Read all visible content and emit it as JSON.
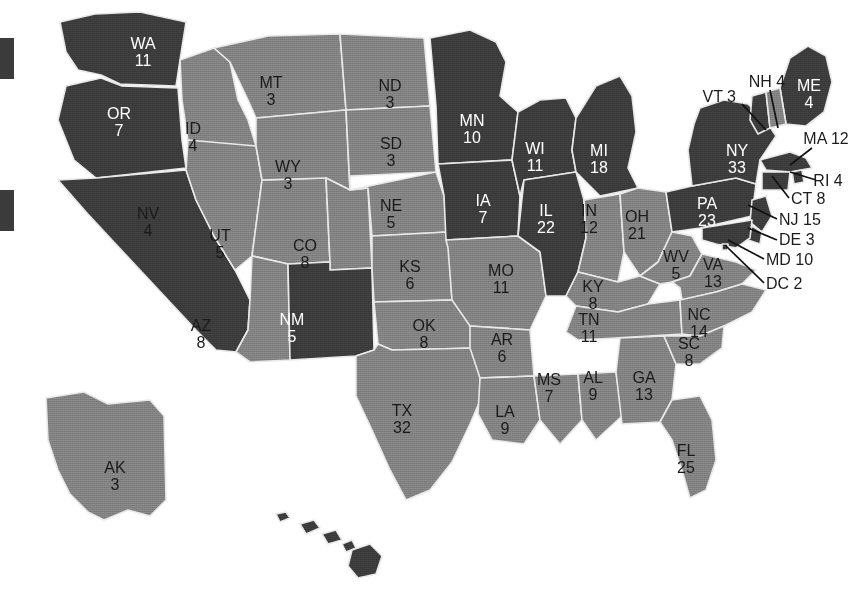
{
  "map": {
    "title": "United States Electoral College Map",
    "colors": {
      "dark_fill": "#3b3b3b",
      "light_fill": "#808080",
      "border": "#e8e8e8",
      "background": "#ffffff",
      "dark_label_text": "#1a1a1a",
      "light_label_text": "#ffffff",
      "leader_line": "#111111"
    },
    "legend": {
      "swatches": [
        {
          "name": "legend-swatch-top",
          "color": "#3b3b3b",
          "x": 0,
          "y": 38,
          "width": 14,
          "height": 41
        },
        {
          "name": "legend-swatch-bottom",
          "color": "#3b3b3b",
          "x": 0,
          "y": 190,
          "width": 14,
          "height": 41
        }
      ]
    },
    "states": [
      {
        "code": "WA",
        "votes": "11",
        "shade": "dark",
        "label_x": 143,
        "label_y": 45
      },
      {
        "code": "OR",
        "votes": "7",
        "shade": "dark",
        "label_x": 119,
        "label_y": 115
      },
      {
        "code": "CA",
        "votes": "54",
        "shade": "dark",
        "label_x": 89,
        "label_y": 240
      },
      {
        "code": "ID",
        "votes": "4",
        "shade": "light",
        "label_x": 193,
        "label_y": 130
      },
      {
        "code": "NV",
        "votes": "4",
        "shade": "light",
        "label_x": 148,
        "label_y": 215
      },
      {
        "code": "UT",
        "votes": "5",
        "shade": "light",
        "label_x": 220,
        "label_y": 237
      },
      {
        "code": "AZ",
        "votes": "8",
        "shade": "light",
        "label_x": 201,
        "label_y": 327
      },
      {
        "code": "MT",
        "votes": "3",
        "shade": "light",
        "label_x": 271,
        "label_y": 84
      },
      {
        "code": "WY",
        "votes": "3",
        "shade": "light",
        "label_x": 288,
        "label_y": 168
      },
      {
        "code": "CO",
        "votes": "8",
        "shade": "light",
        "label_x": 305,
        "label_y": 247
      },
      {
        "code": "NM",
        "votes": "5",
        "shade": "dark",
        "label_x": 292,
        "label_y": 321
      },
      {
        "code": "ND",
        "votes": "3",
        "shade": "light",
        "label_x": 390,
        "label_y": 87
      },
      {
        "code": "SD",
        "votes": "3",
        "shade": "light",
        "label_x": 391,
        "label_y": 145
      },
      {
        "code": "NE",
        "votes": "5",
        "shade": "light",
        "label_x": 391,
        "label_y": 207
      },
      {
        "code": "KS",
        "votes": "6",
        "shade": "light",
        "label_x": 410,
        "label_y": 268
      },
      {
        "code": "OK",
        "votes": "8",
        "shade": "light",
        "label_x": 424,
        "label_y": 327
      },
      {
        "code": "TX",
        "votes": "32",
        "shade": "light",
        "label_x": 402,
        "label_y": 412
      },
      {
        "code": "MN",
        "votes": "10",
        "shade": "dark",
        "label_x": 472,
        "label_y": 122
      },
      {
        "code": "IA",
        "votes": "7",
        "shade": "dark",
        "label_x": 483,
        "label_y": 202
      },
      {
        "code": "MO",
        "votes": "11",
        "shade": "light",
        "label_x": 501,
        "label_y": 272
      },
      {
        "code": "AR",
        "votes": "6",
        "shade": "light",
        "label_x": 502,
        "label_y": 341
      },
      {
        "code": "LA",
        "votes": "9",
        "shade": "light",
        "label_x": 505,
        "label_y": 413
      },
      {
        "code": "WI",
        "votes": "11",
        "shade": "dark",
        "label_x": 535,
        "label_y": 150
      },
      {
        "code": "IL",
        "votes": "22",
        "shade": "dark",
        "label_x": 546,
        "label_y": 212
      },
      {
        "code": "MS",
        "votes": "7",
        "shade": "light",
        "label_x": 549,
        "label_y": 381
      },
      {
        "code": "MI",
        "votes": "18",
        "shade": "dark",
        "label_x": 599,
        "label_y": 152
      },
      {
        "code": "IN",
        "votes": "12",
        "shade": "light",
        "label_x": 589,
        "label_y": 212
      },
      {
        "code": "KY",
        "votes": "8",
        "shade": "light",
        "label_x": 593,
        "label_y": 288
      },
      {
        "code": "AL",
        "votes": "9",
        "shade": "light",
        "label_x": 593,
        "label_y": 379
      },
      {
        "code": "OH",
        "votes": "21",
        "shade": "light",
        "label_x": 637,
        "label_y": 218
      },
      {
        "code": "TN",
        "votes": "11",
        "shade": "light",
        "label_x": 589,
        "label_y": 321
      },
      {
        "code": "GA",
        "votes": "13",
        "shade": "light",
        "label_x": 644,
        "label_y": 379
      },
      {
        "code": "WV",
        "votes": "5",
        "shade": "light",
        "label_x": 676,
        "label_y": 258
      },
      {
        "code": "VA",
        "votes": "13",
        "shade": "light",
        "label_x": 713,
        "label_y": 266
      },
      {
        "code": "NC",
        "votes": "14",
        "shade": "light",
        "label_x": 699,
        "label_y": 316
      },
      {
        "code": "SC",
        "votes": "8",
        "shade": "light",
        "label_x": 689,
        "label_y": 345
      },
      {
        "code": "FL",
        "votes": "25",
        "shade": "light",
        "label_x": 686,
        "label_y": 452
      },
      {
        "code": "PA",
        "votes": "23",
        "shade": "dark",
        "label_x": 707,
        "label_y": 205
      },
      {
        "code": "NY",
        "votes": "33",
        "shade": "dark",
        "label_x": 737,
        "label_y": 152
      },
      {
        "code": "ME",
        "votes": "4",
        "shade": "dark",
        "label_x": 809,
        "label_y": 87
      },
      {
        "code": "AK",
        "votes": "3",
        "shade": "light",
        "label_x": 115,
        "label_y": 469
      },
      {
        "code": "HI",
        "votes": "4",
        "shade": "dark",
        "label_x": 317,
        "label_y": 557
      }
    ],
    "callouts": [
      {
        "code": "VT",
        "votes": "3",
        "text": "VT 3",
        "label_x": 736,
        "label_y": 98,
        "anchor": "end",
        "line": "M742,104 L766,130"
      },
      {
        "code": "NH",
        "votes": "4",
        "text": "NH 4",
        "label_x": 767,
        "label_y": 83,
        "anchor": "middle",
        "line": "M770,90 L778,128"
      },
      {
        "code": "MA",
        "votes": "12",
        "text": "MA 12",
        "label_x": 826,
        "label_y": 140,
        "anchor": "middle",
        "line": "M812,148 L790,165"
      },
      {
        "code": "RI",
        "votes": "4",
        "text": "RI 4",
        "label_x": 828,
        "label_y": 182,
        "anchor": "middle",
        "line": "M816,180 L790,172"
      },
      {
        "code": "CT",
        "votes": "8",
        "text": "CT 8",
        "label_x": 791,
        "label_y": 200,
        "anchor": "start",
        "line": "M789,198 L772,176"
      },
      {
        "code": "NJ",
        "votes": "15",
        "text": "NJ 15",
        "label_x": 779,
        "label_y": 221,
        "anchor": "start",
        "line": "M777,219 L748,205"
      },
      {
        "code": "DE",
        "votes": "3",
        "text": "DE 3",
        "label_x": 779,
        "label_y": 241,
        "anchor": "start",
        "line": "M777,240 L748,228"
      },
      {
        "code": "MD",
        "votes": "10",
        "text": "MD 10",
        "label_x": 766,
        "label_y": 261,
        "anchor": "start",
        "line": "M764,259 L728,240"
      },
      {
        "code": "DC",
        "votes": "2",
        "text": "DC 2",
        "label_x": 766,
        "label_y": 285,
        "anchor": "start",
        "line": "M764,283 L725,245"
      }
    ]
  }
}
